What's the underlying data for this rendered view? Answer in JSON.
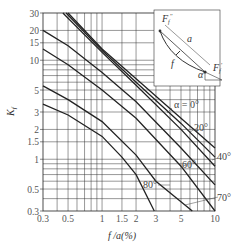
{
  "chart_data": {
    "type": "line",
    "title": "",
    "xlabel": "f / a (%)",
    "ylabel": "K_f",
    "xscale": "log",
    "yscale": "log",
    "xlim": [
      0.3,
      10
    ],
    "ylim": [
      0.3,
      30
    ],
    "grid": true,
    "x_ticks": [
      0.3,
      0.5,
      1,
      1.5,
      2,
      3,
      5,
      10
    ],
    "x_tick_labels": [
      "0.3",
      "0.5",
      "1",
      "1.5",
      "2",
      "3",
      "5",
      "10"
    ],
    "y_ticks": [
      0.3,
      0.5,
      1,
      1.5,
      2,
      3,
      5,
      10,
      15,
      20,
      30
    ],
    "y_tick_labels": [
      "0.3",
      "0.5",
      "1",
      "1.5",
      "2",
      "3",
      "5",
      "10",
      "15",
      "20",
      "30"
    ],
    "series": [
      {
        "name": "α = 0°",
        "x": [
          0.5,
          1,
          2,
          5,
          10
        ],
        "y": [
          30,
          13,
          6.5,
          2.6,
          1.3
        ]
      },
      {
        "name": "20°",
        "x": [
          0.48,
          1,
          2,
          5,
          10
        ],
        "y": [
          30,
          12.5,
          6.0,
          2.3,
          1.05
        ]
      },
      {
        "name": "40°",
        "x": [
          0.45,
          1,
          2,
          5,
          10
        ],
        "y": [
          30,
          12,
          5.6,
          2.0,
          0.85
        ]
      },
      {
        "name": "60°",
        "x": [
          0.3,
          0.5,
          1,
          2,
          5,
          10
        ],
        "y": [
          20,
          14,
          7.5,
          3.8,
          1.3,
          0.55
        ]
      },
      {
        "name": "70°",
        "x": [
          0.3,
          0.5,
          1,
          2,
          5,
          10
        ],
        "y": [
          13,
          9,
          5,
          2.6,
          0.85,
          0.3
        ]
      },
      {
        "name": "80°",
        "x": [
          0.3,
          0.5,
          1,
          2,
          3,
          6.3
        ],
        "y": [
          5.5,
          4,
          2.4,
          1.1,
          0.6,
          0.3
        ]
      },
      {
        "name": "lowest",
        "x": [
          0.3,
          0.5,
          1,
          1.5,
          2,
          2.9
        ],
        "y": [
          3.6,
          2.8,
          1.7,
          1.05,
          0.7,
          0.3
        ]
      }
    ],
    "curve_labels": [
      "α = 0°",
      "20°",
      "40°",
      "60°",
      "70°",
      "80°"
    ],
    "inset": {
      "description": "cable sag diagram",
      "labels": [
        "F_f''",
        "a",
        "f",
        "α",
        "F_f'"
      ]
    }
  },
  "labels": {
    "y_axis": "K",
    "y_axis_sub": "f",
    "x_axis": "f /a(%)",
    "alpha0": "α = 0°",
    "deg20": "20°",
    "deg40": "40°",
    "deg60": "60°",
    "deg70": "70°",
    "deg80": "80°",
    "inset_a": "a",
    "inset_f": "f",
    "inset_alpha": "α",
    "inset_F": "F",
    "inset_sub_top": "f",
    "inset_sup_top": "''",
    "inset_sub_bot": "f",
    "inset_sup_bot": "'"
  },
  "ticks": {
    "x": [
      "0.3",
      "0.5",
      "1",
      "1.5",
      "2",
      "3",
      "5",
      "10"
    ],
    "y": [
      "30",
      "20",
      "15",
      "10",
      "5",
      "3",
      "2",
      "1.5",
      "1",
      "0.5",
      "0.3"
    ]
  }
}
